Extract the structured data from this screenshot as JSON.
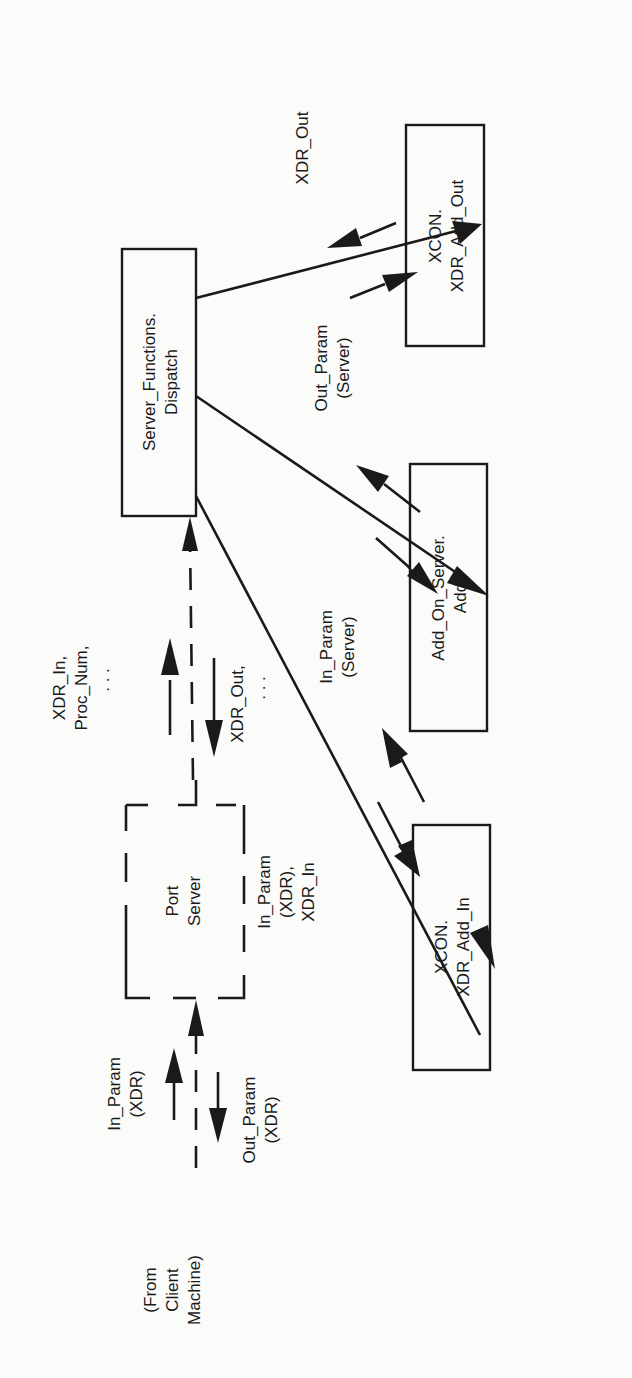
{
  "diagram": {
    "orientation": "rotated 90 degrees counterclockwise",
    "nodes": {
      "dispatch": {
        "line1": "Server_Functions.",
        "line2": "Dispatch",
        "style": "solid"
      },
      "xdr_add_out": {
        "line1": "XCON.",
        "line2": "XDR_Add_Out",
        "style": "solid"
      },
      "add_on_server": {
        "line1": "Add_On_Server.",
        "line2": "Add",
        "style": "solid"
      },
      "xdr_add_in": {
        "line1": "XCON.",
        "line2": "XDR_Add_In",
        "style": "solid"
      },
      "port_server": {
        "line1": "Port",
        "line2": "Server",
        "style": "dashed"
      }
    },
    "labels": {
      "client": {
        "line1": "(From",
        "line2": "Client",
        "line3": "Machine)"
      },
      "in_param_xdr": {
        "line1": "In_Param",
        "line2": "(XDR)"
      },
      "out_param_xdr": {
        "line1": "Out_Param",
        "line2": "(XDR)"
      },
      "xdr_in_proc": {
        "line1": "XDR_In,",
        "line2": "Proc_Num,",
        "line3": ". . ."
      },
      "xdr_out_dots": {
        "line1": "XDR_Out,",
        "line2": ". . ."
      },
      "in_param_xdr_xdr_in": {
        "line1": "In_Param",
        "line2": "(XDR),",
        "line3": "XDR_In"
      },
      "in_param_server": {
        "line1": "In_Param",
        "line2": "(Server)"
      },
      "out_param_server": {
        "line1": "Out_Param",
        "line2": "(Server)"
      },
      "xdr_out": {
        "line1": "XDR_Out"
      }
    },
    "edges": [
      {
        "from": "client",
        "to": "port_server",
        "style": "dashed"
      },
      {
        "from": "port_server",
        "to": "dispatch",
        "style": "dashed"
      },
      {
        "from": "dispatch",
        "to": "xdr_add_in",
        "style": "solid"
      },
      {
        "from": "dispatch",
        "to": "add_on_server",
        "style": "solid"
      },
      {
        "from": "dispatch",
        "to": "xdr_add_out",
        "style": "solid"
      }
    ]
  }
}
